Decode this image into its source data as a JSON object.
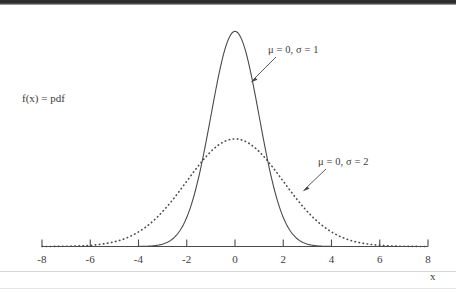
{
  "figure": {
    "background_color": "#ffffff",
    "ink_color": "#3c3c3c",
    "y_axis_label": "f(x) = pdf",
    "x_axis_label": "x"
  },
  "annotations": [
    {
      "text": "μ = 0, σ = 1",
      "target_series": "sigma-1"
    },
    {
      "text": "μ = 0, σ = 2",
      "target_series": "sigma-2"
    }
  ],
  "ticks": [
    {
      "label": "-8",
      "value": -8
    },
    {
      "label": "-6",
      "value": -6
    },
    {
      "label": "-4",
      "value": -4
    },
    {
      "label": "-2",
      "value": -2
    },
    {
      "label": "0",
      "value": 0
    },
    {
      "label": "2",
      "value": 2
    },
    {
      "label": "4",
      "value": 4
    },
    {
      "label": "6",
      "value": 6
    },
    {
      "label": "8",
      "value": 8
    }
  ],
  "chart_data": {
    "type": "line",
    "title": "",
    "subtitle": "",
    "xlabel": "x",
    "ylabel": "f(x) = pdf",
    "xlim": [
      -8,
      8
    ],
    "ylim": [
      0,
      0.42
    ],
    "xticks": [
      -8,
      -6,
      -4,
      -2,
      0,
      2,
      4,
      6,
      8
    ],
    "xticklabels": [
      "-8",
      "-6",
      "-4",
      "-2",
      "0",
      "2",
      "4",
      "6",
      "8"
    ],
    "yticks": [],
    "yticklabels": [],
    "grid": false,
    "legend": "annotations-inline",
    "x": [
      -8,
      -7.5,
      -7,
      -6.5,
      -6,
      -5.5,
      -5,
      -4.5,
      -4,
      -3.5,
      -3,
      -2.5,
      -2,
      -1.5,
      -1,
      -0.5,
      0,
      0.5,
      1,
      1.5,
      2,
      2.5,
      3,
      3.5,
      4,
      4.5,
      5,
      5.5,
      6,
      6.5,
      7,
      7.5,
      8
    ],
    "series": [
      {
        "name": "μ = 0, σ = 1",
        "id": "sigma-1",
        "style": "solid",
        "mu": 0,
        "sigma": 1,
        "peak": 0.3989,
        "values": [
          0,
          0,
          0,
          0,
          0,
          0,
          1.5e-06,
          1.6e-05,
          0.0001338,
          0.0008727,
          0.0044318,
          0.0175283,
          0.053991,
          0.1295176,
          0.2419707,
          0.3520653,
          0.3989423,
          0.3520653,
          0.2419707,
          0.1295176,
          0.053991,
          0.0175283,
          0.0044318,
          0.0008727,
          0.0001338,
          1.6e-05,
          1.5e-06,
          0,
          0,
          0,
          0,
          0,
          0
        ]
      },
      {
        "name": "μ = 0, σ = 2",
        "id": "sigma-2",
        "style": "dotted",
        "mu": 0,
        "sigma": 2,
        "peak": 0.1995,
        "values": [
          0.0002677,
          0.000599,
          0.0012238,
          0.0022846,
          0.0043821,
          0.0076624,
          0.0131801,
          0.021393,
          0.0269955,
          0.0388372,
          0.0647588,
          0.0912519,
          0.1209854,
          0.1506714,
          0.1760327,
          0.1933341,
          0.1994711,
          0.1933341,
          0.1760327,
          0.1506714,
          0.1209854,
          0.0912519,
          0.0647588,
          0.0388372,
          0.0269955,
          0.021393,
          0.0131801,
          0.0076624,
          0.0043821,
          0.0022846,
          0.0012238,
          0.000599,
          0.0002677
        ]
      }
    ]
  }
}
